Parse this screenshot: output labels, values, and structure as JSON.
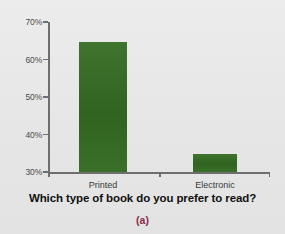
{
  "chart_data": {
    "type": "bar",
    "title": "Which type of book do you prefer to read?",
    "xlabel": "",
    "ylabel": "",
    "categories": [
      "Printed",
      "Electronic"
    ],
    "values": [
      64.7,
      34.8
    ],
    "series": [
      {
        "name": "Preference",
        "values": [
          64.7,
          34.8
        ]
      }
    ],
    "ylim": [
      30,
      70
    ],
    "yticks": [
      30,
      40,
      50,
      60,
      70
    ],
    "ytick_labels": [
      "30%",
      "40%",
      "50%",
      "60%",
      "70%"
    ],
    "grid": false,
    "legend": false,
    "bar_color": "#336b22",
    "background_color": "#e9e9e9",
    "axis_color": "#6e6e6e"
  },
  "caption": {
    "panel_label": "(a)",
    "panel_label_color": "#8d2a4a"
  }
}
